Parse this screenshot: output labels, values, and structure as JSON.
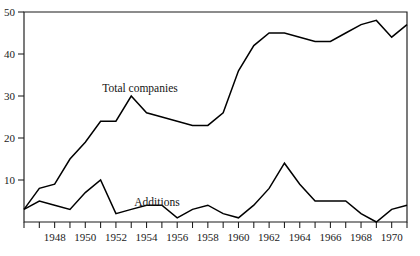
{
  "chart_data": {
    "type": "line",
    "title": "",
    "xlabel": "",
    "ylabel": "",
    "xlim": [
      1946,
      1971
    ],
    "ylim": [
      0,
      50
    ],
    "grid": false,
    "legend_position": "inline-annotation",
    "y_ticks": [
      10,
      20,
      30,
      40,
      50
    ],
    "y_tick_labels": [
      "10",
      "20",
      "30",
      "40",
      "50"
    ],
    "x_ticks": [
      1946,
      1947,
      1948,
      1949,
      1950,
      1951,
      1952,
      1953,
      1954,
      1955,
      1956,
      1957,
      1958,
      1959,
      1960,
      1961,
      1962,
      1963,
      1964,
      1965,
      1966,
      1967,
      1968,
      1969,
      1970,
      1971
    ],
    "x_tick_labels": [
      "1948",
      "1950",
      "1952",
      "1954",
      "1956",
      "1958",
      "1960",
      "1962",
      "1964",
      "1966",
      "1968",
      "1970"
    ],
    "x_labeled_ticks": [
      1948,
      1950,
      1952,
      1954,
      1956,
      1958,
      1960,
      1962,
      1964,
      1966,
      1968,
      1970
    ],
    "x": [
      1946,
      1947,
      1948,
      1949,
      1950,
      1951,
      1952,
      1953,
      1954,
      1955,
      1956,
      1957,
      1958,
      1959,
      1960,
      1961,
      1962,
      1963,
      1964,
      1965,
      1966,
      1967,
      1968,
      1969,
      1970,
      1971
    ],
    "series": [
      {
        "name": "Total companies",
        "label": "Total companies",
        "color": "#000000",
        "values": [
          3,
          8,
          9,
          15,
          19,
          24,
          24,
          30,
          26,
          25,
          24,
          23,
          23,
          26,
          36,
          42,
          45,
          45,
          44,
          43,
          43,
          45,
          47,
          48,
          44,
          47
        ]
      },
      {
        "name": "Additions",
        "label": "Additions",
        "color": "#000000",
        "values": [
          3,
          5,
          4,
          3,
          7,
          10,
          2,
          3,
          4,
          4,
          1,
          3,
          4,
          2,
          1,
          4,
          8,
          14,
          9,
          5,
          5,
          5,
          2,
          0,
          3,
          4
        ]
      }
    ],
    "annotations": [
      {
        "text": "Total companies",
        "x_px": 140,
        "y_px": 92,
        "series": "Total companies"
      },
      {
        "text": "Additions",
        "x_px": 157,
        "y_px": 206,
        "series": "Additions"
      }
    ]
  },
  "axes": {
    "y_label_x_px": 20,
    "frame": {
      "left": 24,
      "right": 407,
      "top": 12,
      "bottom": 222
    }
  }
}
